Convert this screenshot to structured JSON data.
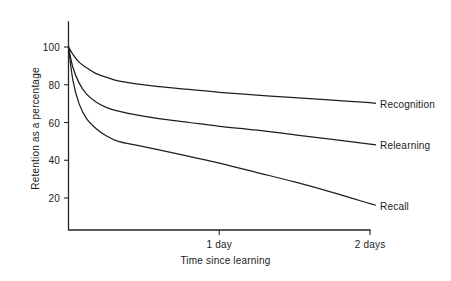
{
  "chart_data": {
    "type": "line",
    "title": "",
    "subtitle": "",
    "xlabel": "Time since learning",
    "ylabel": "Retention as a percentage",
    "grid": false,
    "legend_position": "right-of-curve-end",
    "x_ticks": [
      {
        "label": "1 day",
        "value": 1
      },
      {
        "label": "2 days",
        "value": 2
      }
    ],
    "y_ticks": [
      {
        "label": "20",
        "value": 20
      },
      {
        "label": "40",
        "value": 40
      },
      {
        "label": "60",
        "value": 60
      },
      {
        "label": "80",
        "value": 80
      },
      {
        "label": "100",
        "value": 100
      }
    ],
    "xlim": [
      0,
      2.1
    ],
    "ylim": [
      0,
      110
    ],
    "x": [
      0,
      0.03,
      0.07,
      0.12,
      0.18,
      0.25,
      0.33,
      0.45,
      0.6,
      0.8,
      1.0,
      1.25,
      1.5,
      1.75,
      2.0
    ],
    "series": [
      {
        "name": "Recognition",
        "color": "#1f1f1f",
        "values": [
          100,
          96,
          92,
          89,
          86,
          84,
          82,
          80.5,
          79,
          77.5,
          76,
          74.5,
          73.2,
          71.8,
          70.5
        ]
      },
      {
        "name": "Relearning",
        "color": "#1f1f1f",
        "values": [
          100,
          89,
          81,
          75,
          71,
          68,
          66,
          64,
          62,
          60,
          58,
          56,
          53.5,
          51,
          48.5
        ]
      },
      {
        "name": "Recall",
        "color": "#1f1f1f",
        "values": [
          100,
          82,
          70,
          62,
          57,
          53,
          50,
          48,
          45.5,
          42,
          38.5,
          33.5,
          28.5,
          23,
          17
        ]
      }
    ]
  },
  "labels": {
    "recognition": "Recognition",
    "relearning": "Relearning",
    "recall": "Recall"
  }
}
